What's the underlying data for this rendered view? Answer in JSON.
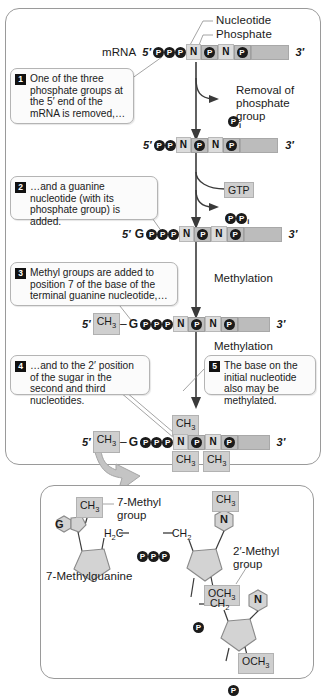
{
  "figure": {
    "top_labels": {
      "nucleotide": "Nucleotide",
      "phosphate": "Phosphate"
    },
    "mrna_label": "mRNA",
    "five_prime": "5′",
    "three_prime": "3′",
    "process_labels": {
      "removal": "Removal of\nphosphate\ngroup",
      "gtp": "GTP",
      "ppi": "PP",
      "ppi_sub": "i",
      "pi": "P",
      "pi_sub": "i",
      "methylation_1": "Methylation",
      "methylation_2": "Methylation"
    },
    "steps": [
      {
        "number": "1",
        "text": "One of the three phosphate groups at the 5′ end of the mRNA is removed,…"
      },
      {
        "number": "2",
        "text": "…and a guanine nucleotide (with its phosphate group) is added."
      },
      {
        "number": "3",
        "text": "Methyl groups are added to position 7 of the base of the terminal guanine nucleotide,…"
      },
      {
        "number": "4",
        "text": "…and to the 2′ position of the sugar in the second and third nucleotides."
      },
      {
        "number": "5",
        "text": "The base on the initial nucleotide also may be methylated."
      }
    ],
    "sequences": [
      {
        "id": "seq-0",
        "prefix": "mRNA",
        "p_count": 3,
        "guanine": false,
        "ch3_prefix": false
      },
      {
        "id": "seq-1",
        "prefix": "",
        "p_count": 2,
        "guanine": false,
        "ch3_prefix": false
      },
      {
        "id": "seq-2",
        "prefix": "",
        "p_count": 3,
        "guanine": true,
        "ch3_prefix": false
      },
      {
        "id": "seq-3",
        "prefix": "",
        "p_count": 3,
        "guanine": true,
        "ch3_prefix": true
      },
      {
        "id": "seq-4",
        "prefix": "",
        "p_count": 3,
        "guanine": true,
        "ch3_prefix": true
      }
    ],
    "methyl_marks": {
      "top": "CH",
      "top_sub": "3",
      "bottom_left": "CH",
      "bottom_left_sub": "3",
      "bottom_right": "CH",
      "bottom_right_sub": "3"
    },
    "detail": {
      "seven_methyl_group": "7-Methyl\ngroup",
      "two_prime_methyl_group": "2′-Methyl\ngroup",
      "seven_methylguanine": "7-Methylguanine",
      "ch3_top_left": "CH",
      "ch3_top_left_sub": "3",
      "ch3_top_right": "CH",
      "ch3_top_right_sub": "3",
      "h2c": "H",
      "h2c_sub": "2",
      "h2c_rest": "C",
      "ch2_right": "CH",
      "ch2_right_sub": "2",
      "ch2_lower": "CH",
      "ch2_lower_sub": "2",
      "och3_upper": "OCH",
      "och3_upper_sub": "3",
      "och3_lower": "OCH",
      "och3_lower_sub": "3",
      "g_letter": "G",
      "n_letter_upper": "N",
      "n_letter_lower": "N",
      "p_letter": "P",
      "phosphate_chain": [
        "P",
        "P",
        "P"
      ]
    },
    "colors": {
      "phosphate_circle": "#1b1b1b",
      "nucleotide_box": "#dcdcdc",
      "phosphate_box": "#bdbdbd",
      "tail_bar": "#bcbcbc",
      "methyl_box": "#cfcfcf",
      "panel_border": "#9a9a9a",
      "badge_bg": "#111111"
    }
  }
}
